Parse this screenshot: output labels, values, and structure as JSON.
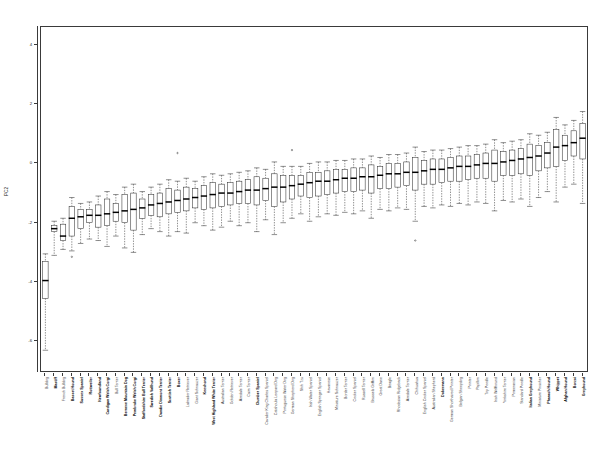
{
  "figure": {
    "type": "boxplot-figure",
    "background": "#ffffff",
    "frame_color": "#3a3a3a",
    "box_fill": "#ffffff",
    "median_color": "#000000"
  },
  "axes": {
    "ylabel": "PC2",
    "xlabel": "",
    "title": "",
    "ytick_labels": [
      "4",
      "2",
      "0",
      "-2",
      "-4",
      "-6"
    ],
    "ytick_values": [
      4,
      2,
      0,
      -2,
      -4,
      -6
    ],
    "ylim": [
      -7.0,
      4.6
    ],
    "grid": false
  },
  "chart_data": {
    "type": "box",
    "title": "",
    "xlabel": "",
    "ylabel": "PC2",
    "ylim": [
      -7.0,
      4.6
    ],
    "grid": false,
    "legend": null,
    "note": "Boxplot of PC2 by dog breed, breeds sorted by increasing median. Values are q1/median/q3 with whisker low/high and outliers, read off the axis.",
    "categories": [
      "Bulldog",
      "Mastiff",
      "French Bulldog",
      "Basset Hound",
      "Sussex Spaniel",
      "Rottweiler",
      "Newfoundland",
      "Cardigan Welsh Corgi",
      "Bull Terrier",
      "Bernese Mountain Dog",
      "Pembroke Welsh Corgi",
      "Staffordshire Bull Terrier",
      "Swedish Vallhund",
      "Dandie Dinmont Terrier",
      "Scottish Terrier",
      "Boxer",
      "Labrador Retriever",
      "Giant Schnauzer",
      "Keeshond",
      "West Highland White Terrier",
      "Australian Terrier",
      "Golden Retriever",
      "Airedale Terrier",
      "Cairn Terrier",
      "Clumber Spaniel",
      "Cavalier King Charles Spaniel",
      "Catahoula Leopard Dog",
      "Portuguese Water Dog",
      "German Shepherd Dog",
      "Shih Tzu",
      "Irish Water Spaniel",
      "English Springer Spaniel",
      "Havanese",
      "Miniature Schnauzer",
      "Border Terrier",
      "Cocker Spaniel",
      "Russell Terrier",
      "Brussels Griffon",
      "Great Dane",
      "Beagle",
      "Rhodesian Ridgeback",
      "Airedale Terrier",
      "Chihuahua",
      "English Cocker Spaniel",
      "Australian Shepherd",
      "Dobermann",
      "German Shorthaired Pointer",
      "Belgian Sheepdog",
      "Pointer",
      "Papillon",
      "Toy Poodle",
      "Irish Wolfhound",
      "Yorkshire Terrier",
      "Pomeranian",
      "Standard Poodle",
      "Italian Greyhound",
      "Miniature Pinscher",
      "Pharaoh Hound",
      "Whippet",
      "Afghan Hound",
      "Borzoi",
      "Greyhound"
    ],
    "bold_categories": [
      "Mastiff",
      "Basset Hound",
      "Sussex Spaniel",
      "Rottweiler",
      "Newfoundland",
      "Cardigan Welsh Corgi",
      "Bernese Mountain Dog",
      "Pembroke Welsh Corgi",
      "Staffordshire Bull Terrier",
      "Swedish Vallhund",
      "Dandie Dinmont Terrier",
      "Scottish Terrier",
      "Boxer",
      "Keeshond",
      "West Highland White Terrier",
      "Clumber Spaniel",
      "Dobermann",
      "Pharaoh Hound",
      "Italian Greyhound",
      "Whippet",
      "Afghan Hound",
      "Borzoi",
      "Greyhound"
    ],
    "boxes": [
      {
        "category": "Bulldog",
        "whisker_low": -6.3,
        "q1": -4.55,
        "median": -3.95,
        "q3": -3.3,
        "whisker_high": -3.05,
        "outliers": []
      },
      {
        "category": "Mastiff",
        "whisker_low": -3.1,
        "q1": -2.3,
        "median": -2.2,
        "q3": -2.1,
        "whisker_high": -1.95,
        "outliers": []
      },
      {
        "category": "French Bulldog",
        "whisker_low": -2.9,
        "q1": -2.6,
        "median": -2.45,
        "q3": -2.05,
        "whisker_high": -1.85,
        "outliers": []
      },
      {
        "category": "Basset Hound",
        "whisker_low": -2.95,
        "q1": -2.45,
        "median": -1.85,
        "q3": -1.45,
        "whisker_high": -1.15,
        "outliers": [
          -3.15
        ]
      },
      {
        "category": "Sussex Spaniel",
        "whisker_low": -2.7,
        "q1": -2.2,
        "median": -1.8,
        "q3": -1.55,
        "whisker_high": -1.35,
        "outliers": []
      },
      {
        "category": "Rottweiler",
        "whisker_low": -2.55,
        "q1": -2.0,
        "median": -1.75,
        "q3": -1.55,
        "whisker_high": -1.3,
        "outliers": []
      },
      {
        "category": "Newfoundland",
        "whisker_low": -2.6,
        "q1": -2.15,
        "median": -1.75,
        "q3": -1.4,
        "whisker_high": -1.1,
        "outliers": []
      },
      {
        "category": "Cardigan Welsh Corgi",
        "whisker_low": -2.8,
        "q1": -2.1,
        "median": -1.7,
        "q3": -1.2,
        "whisker_high": -0.95,
        "outliers": []
      },
      {
        "category": "Bull Terrier",
        "whisker_low": -2.45,
        "q1": -1.95,
        "median": -1.65,
        "q3": -1.35,
        "whisker_high": -1.05,
        "outliers": []
      },
      {
        "category": "Bernese Mountain Dog",
        "whisker_low": -2.85,
        "q1": -2.0,
        "median": -1.6,
        "q3": -1.05,
        "whisker_high": -0.8,
        "outliers": []
      },
      {
        "category": "Pembroke Welsh Corgi",
        "whisker_low": -3.0,
        "q1": -2.25,
        "median": -1.55,
        "q3": -1.0,
        "whisker_high": -0.7,
        "outliers": []
      },
      {
        "category": "Staffordshire Bull Terrier",
        "whisker_low": -2.4,
        "q1": -1.85,
        "median": -1.5,
        "q3": -1.2,
        "whisker_high": -0.95,
        "outliers": []
      },
      {
        "category": "Swedish Vallhund",
        "whisker_low": -2.2,
        "q1": -1.75,
        "median": -1.4,
        "q3": -1.05,
        "whisker_high": -0.8,
        "outliers": []
      },
      {
        "category": "Dandie Dinmont Terrier",
        "whisker_low": -2.3,
        "q1": -1.8,
        "median": -1.35,
        "q3": -1.0,
        "whisker_high": -0.7,
        "outliers": []
      },
      {
        "category": "Scottish Terrier",
        "whisker_low": -2.45,
        "q1": -1.7,
        "median": -1.3,
        "q3": -0.85,
        "whisker_high": -0.55,
        "outliers": []
      },
      {
        "category": "Boxer",
        "whisker_low": -2.3,
        "q1": -1.65,
        "median": -1.25,
        "q3": -0.9,
        "whisker_high": -0.6,
        "outliers": [
          0.35
        ]
      },
      {
        "category": "Labrador Retriever",
        "whisker_low": -2.35,
        "q1": -1.6,
        "median": -1.2,
        "q3": -0.8,
        "whisker_high": -0.5,
        "outliers": []
      },
      {
        "category": "Giant Schnauzer",
        "whisker_low": -2.0,
        "q1": -1.5,
        "median": -1.15,
        "q3": -0.85,
        "whisker_high": -0.6,
        "outliers": []
      },
      {
        "category": "Keeshond",
        "whisker_low": -2.1,
        "q1": -1.55,
        "median": -1.1,
        "q3": -0.75,
        "whisker_high": -0.45,
        "outliers": []
      },
      {
        "category": "West Highland White Terrier",
        "whisker_low": -2.25,
        "q1": -1.5,
        "median": -1.05,
        "q3": -0.65,
        "whisker_high": -0.35,
        "outliers": []
      },
      {
        "category": "Australian Terrier",
        "whisker_low": -2.15,
        "q1": -1.45,
        "median": -1.0,
        "q3": -0.7,
        "whisker_high": -0.4,
        "outliers": []
      },
      {
        "category": "Golden Retriever",
        "whisker_low": -1.95,
        "q1": -1.4,
        "median": -1.0,
        "q3": -0.65,
        "whisker_high": -0.35,
        "outliers": []
      },
      {
        "category": "Airedale Terrier",
        "whisker_low": -2.1,
        "q1": -1.35,
        "median": -0.95,
        "q3": -0.6,
        "whisker_high": -0.3,
        "outliers": []
      },
      {
        "category": "Cairn Terrier",
        "whisker_low": -2.0,
        "q1": -1.35,
        "median": -0.9,
        "q3": -0.55,
        "whisker_high": -0.25,
        "outliers": []
      },
      {
        "category": "Clumber Spaniel",
        "whisker_low": -2.3,
        "q1": -1.4,
        "median": -0.9,
        "q3": -0.45,
        "whisker_high": -0.15,
        "outliers": []
      },
      {
        "category": "Cavalier King Charles Spaniel",
        "whisker_low": -1.9,
        "q1": -1.25,
        "median": -0.85,
        "q3": -0.5,
        "whisker_high": -0.2,
        "outliers": []
      },
      {
        "category": "Catahoula Leopard Dog",
        "whisker_low": -2.4,
        "q1": -1.45,
        "median": -0.8,
        "q3": -0.35,
        "whisker_high": 0.05,
        "outliers": []
      },
      {
        "category": "Portuguese Water Dog",
        "whisker_low": -2.0,
        "q1": -1.3,
        "median": -0.8,
        "q3": -0.4,
        "whisker_high": -0.1,
        "outliers": []
      },
      {
        "category": "German Shepherd Dog",
        "whisker_low": -1.85,
        "q1": -1.2,
        "median": -0.75,
        "q3": -0.4,
        "whisker_high": -0.1,
        "outliers": [
          0.45
        ]
      },
      {
        "category": "Shih Tzu",
        "whisker_low": -1.7,
        "q1": -1.1,
        "median": -0.7,
        "q3": -0.4,
        "whisker_high": -0.1,
        "outliers": []
      },
      {
        "category": "Irish Water Spaniel",
        "whisker_low": -1.95,
        "q1": -1.15,
        "median": -0.65,
        "q3": -0.3,
        "whisker_high": 0.0,
        "outliers": []
      },
      {
        "category": "English Springer Spaniel",
        "whisker_low": -1.8,
        "q1": -1.1,
        "median": -0.6,
        "q3": -0.3,
        "whisker_high": 0.05,
        "outliers": []
      },
      {
        "category": "Havanese",
        "whisker_low": -1.7,
        "q1": -1.05,
        "median": -0.6,
        "q3": -0.25,
        "whisker_high": 0.05,
        "outliers": []
      },
      {
        "category": "Miniature Schnauzer",
        "whisker_low": -1.75,
        "q1": -1.0,
        "median": -0.55,
        "q3": -0.2,
        "whisker_high": 0.1,
        "outliers": []
      },
      {
        "category": "Border Terrier",
        "whisker_low": -1.65,
        "q1": -0.95,
        "median": -0.5,
        "q3": -0.2,
        "whisker_high": 0.1,
        "outliers": []
      },
      {
        "category": "Cocker Spaniel",
        "whisker_low": -1.7,
        "q1": -0.95,
        "median": -0.5,
        "q3": -0.15,
        "whisker_high": 0.15,
        "outliers": []
      },
      {
        "category": "Russell Terrier",
        "whisker_low": -1.6,
        "q1": -0.9,
        "median": -0.45,
        "q3": -0.15,
        "whisker_high": 0.15,
        "outliers": []
      },
      {
        "category": "Brussels Griffon",
        "whisker_low": -1.85,
        "q1": -1.0,
        "median": -0.45,
        "q3": -0.05,
        "whisker_high": 0.25,
        "outliers": []
      },
      {
        "category": "Great Dane",
        "whisker_low": -1.55,
        "q1": -0.85,
        "median": -0.4,
        "q3": -0.1,
        "whisker_high": 0.2,
        "outliers": []
      },
      {
        "category": "Beagle",
        "whisker_low": -1.6,
        "q1": -0.85,
        "median": -0.35,
        "q3": 0.0,
        "whisker_high": 0.3,
        "outliers": []
      },
      {
        "category": "Rhodesian Ridgeback",
        "whisker_low": -1.5,
        "q1": -0.8,
        "median": -0.35,
        "q3": 0.0,
        "whisker_high": 0.3,
        "outliers": []
      },
      {
        "category": "Airedale Terrier",
        "whisker_low": -1.55,
        "q1": -0.75,
        "median": -0.3,
        "q3": 0.05,
        "whisker_high": 0.35,
        "outliers": []
      },
      {
        "category": "Chihuahua",
        "whisker_low": -1.95,
        "q1": -0.9,
        "median": -0.3,
        "q3": 0.2,
        "whisker_high": 0.55,
        "outliers": [
          -2.6
        ]
      },
      {
        "category": "English Cocker Spaniel",
        "whisker_low": -1.45,
        "q1": -0.7,
        "median": -0.25,
        "q3": 0.1,
        "whisker_high": 0.4,
        "outliers": []
      },
      {
        "category": "Australian Shepherd",
        "whisker_low": -1.5,
        "q1": -0.7,
        "median": -0.2,
        "q3": 0.15,
        "whisker_high": 0.45,
        "outliers": []
      },
      {
        "category": "Dobermann",
        "whisker_low": -1.4,
        "q1": -0.65,
        "median": -0.2,
        "q3": 0.15,
        "whisker_high": 0.45,
        "outliers": []
      },
      {
        "category": "German Shorthaired Pointer",
        "whisker_low": -1.45,
        "q1": -0.6,
        "median": -0.15,
        "q3": 0.2,
        "whisker_high": 0.5,
        "outliers": []
      },
      {
        "category": "Belgian Sheepdog",
        "whisker_low": -1.35,
        "q1": -0.6,
        "median": -0.1,
        "q3": 0.25,
        "whisker_high": 0.55,
        "outliers": []
      },
      {
        "category": "Pointer",
        "whisker_low": -1.4,
        "q1": -0.55,
        "median": -0.1,
        "q3": 0.25,
        "whisker_high": 0.6,
        "outliers": []
      },
      {
        "category": "Papillon",
        "whisker_low": -1.3,
        "q1": -0.5,
        "median": -0.05,
        "q3": 0.3,
        "whisker_high": 0.6,
        "outliers": []
      },
      {
        "category": "Toy Poodle",
        "whisker_low": -1.35,
        "q1": -0.5,
        "median": 0.0,
        "q3": 0.35,
        "whisker_high": 0.65,
        "outliers": []
      },
      {
        "category": "Irish Wolfhound",
        "whisker_low": -1.6,
        "q1": -0.6,
        "median": 0.0,
        "q3": 0.45,
        "whisker_high": 0.8,
        "outliers": []
      },
      {
        "category": "Yorkshire Terrier",
        "whisker_low": -1.25,
        "q1": -0.4,
        "median": 0.05,
        "q3": 0.4,
        "whisker_high": 0.7,
        "outliers": []
      },
      {
        "category": "Pomeranian",
        "whisker_low": -1.3,
        "q1": -0.4,
        "median": 0.1,
        "q3": 0.45,
        "whisker_high": 0.75,
        "outliers": []
      },
      {
        "category": "Standard Poodle",
        "whisker_low": -1.2,
        "q1": -0.35,
        "median": 0.15,
        "q3": 0.5,
        "whisker_high": 0.8,
        "outliers": []
      },
      {
        "category": "Italian Greyhound",
        "whisker_low": -1.45,
        "q1": -0.4,
        "median": 0.2,
        "q3": 0.65,
        "whisker_high": 1.0,
        "outliers": []
      },
      {
        "category": "Miniature Pinscher",
        "whisker_low": -1.15,
        "q1": -0.25,
        "median": 0.25,
        "q3": 0.6,
        "whisker_high": 0.95,
        "outliers": []
      },
      {
        "category": "Pharaoh Hound",
        "whisker_low": -0.95,
        "q1": -0.15,
        "median": 0.35,
        "q3": 0.7,
        "whisker_high": 1.05,
        "outliers": []
      },
      {
        "category": "Whippet",
        "whisker_low": -1.3,
        "q1": -0.1,
        "median": 0.55,
        "q3": 1.15,
        "whisker_high": 1.55,
        "outliers": []
      },
      {
        "category": "Afghan Hound",
        "whisker_low": -0.8,
        "q1": 0.1,
        "median": 0.6,
        "q3": 0.95,
        "whisker_high": 1.3,
        "outliers": []
      },
      {
        "category": "Borzoi",
        "whisker_low": -0.7,
        "q1": 0.25,
        "median": 0.7,
        "q3": 1.1,
        "whisker_high": 1.45,
        "outliers": []
      },
      {
        "category": "Greyhound",
        "whisker_low": -1.35,
        "q1": 0.15,
        "median": 0.85,
        "q3": 1.35,
        "whisker_high": 1.75,
        "outliers": []
      }
    ]
  }
}
